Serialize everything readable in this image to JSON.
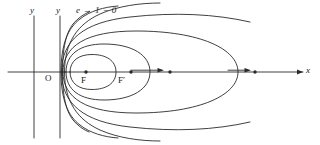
{
  "figure": {
    "kind": "conic-family-diagram",
    "stroke_color": "#2a2a2a",
    "background_color": "#ffffff",
    "labels": {
      "y_axis_left": "y",
      "y_axis_right": "y",
      "x_axis": "x",
      "origin": "O",
      "focus": "F",
      "focus_prime": "F′",
      "eccentricity": "e → 1 − 0",
      "eccentricity_symbol": "e",
      "eccentricity_arrow": "→",
      "eccentricity_limit": "1 − 0"
    },
    "points": [
      {
        "name": "focus-dot-F",
        "x": 86,
        "y": 72
      },
      {
        "name": "focus-dot-F-prime",
        "x": 131,
        "y": 72
      },
      {
        "name": "focus-dot-mid",
        "x": 170,
        "y": 72
      },
      {
        "name": "focus-dot-right",
        "x": 255,
        "y": 72
      }
    ],
    "arrows": [
      {
        "name": "motion-arrow-left",
        "from_x": 131,
        "to_x": 163,
        "y": 72
      },
      {
        "name": "motion-arrow-right",
        "from_x": 230,
        "to_x": 252,
        "y": 72
      }
    ],
    "axes": {
      "x_axis": {
        "x1": 8,
        "y1": 72,
        "x2": 305,
        "y2": 72
      },
      "y_axis_left": {
        "x": 34,
        "y1": 16,
        "y2": 138
      },
      "y_axis_right": {
        "x": 60,
        "y1": 16,
        "y2": 138
      }
    }
  }
}
